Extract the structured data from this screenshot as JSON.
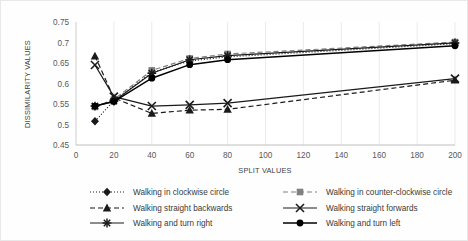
{
  "chart_data": {
    "type": "line",
    "title": "",
    "xlabel": "SPLIT VALUES",
    "ylabel": "DISSIMILARITY VALUES",
    "xlim": [
      0,
      200
    ],
    "ylim": [
      0.45,
      0.75
    ],
    "x_ticks": [
      0,
      20,
      40,
      60,
      80,
      100,
      120,
      140,
      160,
      180,
      200
    ],
    "y_ticks": [
      0.45,
      0.5,
      0.55,
      0.6,
      0.65,
      0.7,
      0.75
    ],
    "grid": "vertical",
    "legend_position": "bottom",
    "x": [
      10,
      20,
      40,
      60,
      80,
      200
    ],
    "series": [
      {
        "name": "Walking in clockwise circle",
        "marker": "diamond",
        "line": "dotted",
        "color": "#1a1a1a",
        "values": [
          0.508,
          0.558,
          0.627,
          0.655,
          0.665,
          0.697
        ]
      },
      {
        "name": "Walking in counter-clockwise circle",
        "marker": "square",
        "line": "dashed",
        "color": "#808080",
        "values": [
          0.543,
          0.561,
          0.632,
          0.661,
          0.672,
          0.701
        ]
      },
      {
        "name": "Walking straight backwards",
        "marker": "triangle",
        "line": "dashed",
        "color": "#1a1a1a",
        "values": [
          0.667,
          0.565,
          0.527,
          0.535,
          0.537,
          0.608
        ]
      },
      {
        "name": "Walking straight forwards",
        "marker": "x",
        "line": "solid",
        "color": "#1a1a1a",
        "values": [
          0.645,
          0.568,
          0.545,
          0.548,
          0.552,
          0.612
        ]
      },
      {
        "name": "Walking and turn right",
        "marker": "asterisk",
        "line": "solid",
        "color": "#1a1a1a",
        "values": [
          0.545,
          0.557,
          0.625,
          0.658,
          0.668,
          0.699
        ]
      },
      {
        "name": "Walking and turn left",
        "marker": "circle",
        "line": "solid",
        "color": "#000000",
        "values": [
          0.545,
          0.556,
          0.613,
          0.646,
          0.658,
          0.692
        ]
      }
    ]
  },
  "axes": {
    "y_title": "DISSIMILARITY VALUES",
    "x_title": "SPLIT VALUES",
    "y_tick_labels": [
      "0.75",
      "0.7",
      "0.65",
      "0.6",
      "0.55",
      "0.5",
      "0.45"
    ],
    "x_tick_labels": [
      "0",
      "20",
      "40",
      "60",
      "80",
      "100",
      "120",
      "140",
      "160",
      "180",
      "200"
    ]
  },
  "legend": {
    "entries": [
      {
        "label": "Walking in clockwise circle"
      },
      {
        "label": "Walking in counter-clockwise circle"
      },
      {
        "label": "Walking straight backwards"
      },
      {
        "label": "Walking straight forwards"
      },
      {
        "label": "Walking and turn right"
      },
      {
        "label": "Walking and turn left"
      }
    ]
  }
}
